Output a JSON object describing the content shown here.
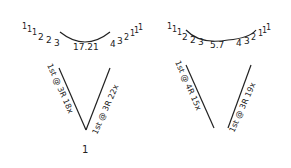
{
  "diagrams": [
    {
      "name": "left",
      "top_numbers": [
        "1",
        "1",
        "1",
        "2",
        "2",
        "3"
      ],
      "center_value": "17.21",
      "right_numbers": [
        "4",
        "3",
        "2",
        "1",
        "1",
        "1"
      ],
      "left_leg_label": "1st @ 3R 18x",
      "right_leg_label": "1st @ 3R 22x",
      "bottom_label": "1"
    },
    {
      "name": "right",
      "top_numbers": [
        "1",
        "1",
        "1",
        "2",
        "2",
        "3"
      ],
      "center_value": "5.7",
      "right_numbers": [
        "4",
        "3",
        "2",
        "1",
        "1",
        "1"
      ],
      "left_leg_label": "1st @ 4R 15x",
      "right_leg_label": "1st @ 3R 19x",
      "bottom_label": ""
    }
  ],
  "colors": {
    "ink": "#222222",
    "paper": "#ffffff"
  }
}
